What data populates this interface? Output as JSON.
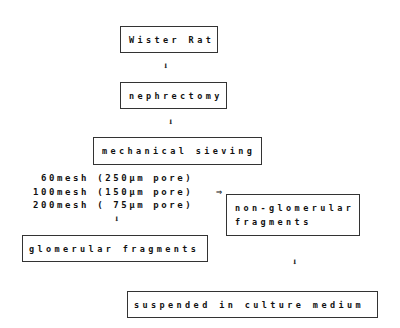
{
  "steps": {
    "source": "Wister Rat",
    "surgery": "nephrectomy",
    "sieving": "mechanical sieving",
    "mesh_lines": [
      " 60mesh (250µm pore)",
      "100mesh (150µm pore)",
      "200mesh ( 75µm pore)"
    ],
    "non_glomerular": [
      "non-glomerular",
      "fragments"
    ],
    "glomerular": "glomerular fragments",
    "final": "suspended in culture medium"
  },
  "arrows": {
    "down": "⬇",
    "right": "⇒"
  }
}
